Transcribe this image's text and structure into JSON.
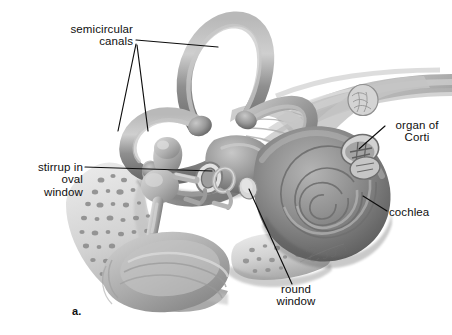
{
  "figure": {
    "panel_label": "a.",
    "artist_signature": "Simon",
    "background_color": "#ffffff",
    "line_color": "#0d0d0d",
    "text_color": "#101010"
  },
  "labels": {
    "semicircular_canals": "semicircular\ncanals",
    "stirrup_oval_window": "stirrup in\noval\nwindow",
    "organ_of_corti": "organ of\nCorti",
    "cochlea": "cochlea",
    "round_window": "round\nwindow"
  },
  "anatomy": {
    "parts": [
      "semicircular canals",
      "vestibule",
      "stirrup in oval window",
      "round window",
      "cochlea",
      "organ of Corti",
      "auditory nerve",
      "eardrum",
      "bone"
    ],
    "palette": {
      "canal_fill": "#9a9a9a",
      "canal_highlight": "#c9c9c9",
      "canal_shadow": "#6e6e6e",
      "cochlea_fill": "#8e8e8e",
      "cochlea_dark": "#5f5f5f",
      "nerve_fill": "#bdbdbd",
      "bone_fill": "#d5d5d5",
      "bone_speckle": "#8b8b8b",
      "eardrum_fill": "#b2b2b2"
    }
  }
}
